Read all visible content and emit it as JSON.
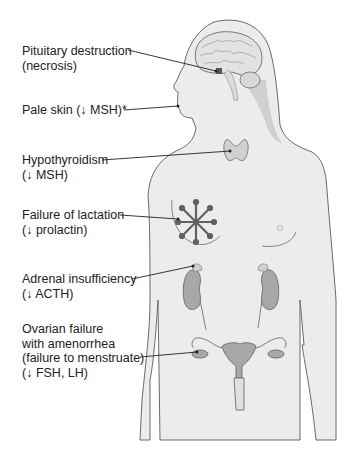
{
  "figure": {
    "type": "anatomical-diagram",
    "colors": {
      "background": "#ffffff",
      "body_fill": "#ececec",
      "body_outline": "#6a6a6a",
      "organ_fill": "#a8a8a8",
      "organ_dark": "#606060",
      "text": "#222222",
      "leader_line": "#222222"
    },
    "labels": [
      {
        "id": "pituitary",
        "lines": [
          "Pituitary destruction",
          "(necrosis)"
        ]
      },
      {
        "id": "skin",
        "lines": [
          "Pale skin (↓ MSH)*"
        ]
      },
      {
        "id": "thyroid",
        "lines": [
          "Hypothyroidism",
          "(↓ MSH)"
        ]
      },
      {
        "id": "breast",
        "lines": [
          "Failure of lactation",
          "(↓ prolactin)"
        ]
      },
      {
        "id": "adrenal",
        "lines": [
          "Adrenal insufficiency",
          "(↓ ACTH)"
        ]
      },
      {
        "id": "ovary",
        "lines": [
          "Ovarian failure",
          "with amenorrhea",
          "(failure to menstruate)",
          "(↓ FSH, LH)"
        ]
      }
    ]
  }
}
